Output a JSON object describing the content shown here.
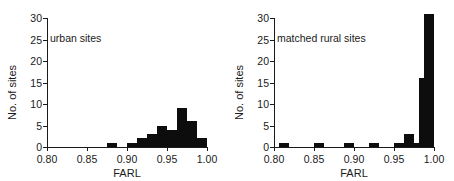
{
  "figure": {
    "panels": [
      {
        "id": "urban",
        "title": "urban sites",
        "xlabel": "FARL",
        "ylabel": "No. of sites"
      },
      {
        "id": "matched-rural",
        "title": "matched rural sites",
        "xlabel": "FARL",
        "ylabel": "No. of sites"
      }
    ],
    "colors": {
      "bar": "#0d0d0d",
      "axis": "#1a1a1a",
      "background": "#ffffff"
    }
  },
  "chart_data": [
    {
      "type": "bar",
      "title": "urban sites",
      "xlabel": "FARL",
      "ylabel": "No. of sites",
      "xlim": [
        0.8,
        1.0
      ],
      "ylim": [
        0,
        30
      ],
      "xticks": [
        "0.80",
        "0.85",
        "0.90",
        "0.95",
        "1.00"
      ],
      "xtick_values": [
        0.8,
        0.85,
        0.9,
        0.95,
        1.0
      ],
      "yticks": [
        "0",
        "5",
        "10",
        "15",
        "20",
        "25",
        "30"
      ],
      "ytick_values": [
        0,
        5,
        10,
        15,
        20,
        25,
        30
      ],
      "grid": false,
      "legend": "none",
      "bin_width": 0.0125,
      "bins": [
        {
          "left": 0.875,
          "right": 0.8875,
          "value": 1
        },
        {
          "left": 0.8875,
          "right": 0.9,
          "value": 0
        },
        {
          "left": 0.9,
          "right": 0.9125,
          "value": 1
        },
        {
          "left": 0.9125,
          "right": 0.925,
          "value": 2
        },
        {
          "left": 0.925,
          "right": 0.9375,
          "value": 3
        },
        {
          "left": 0.9375,
          "right": 0.95,
          "value": 5
        },
        {
          "left": 0.95,
          "right": 0.9625,
          "value": 4
        },
        {
          "left": 0.9625,
          "right": 0.975,
          "value": 9
        },
        {
          "left": 0.975,
          "right": 0.9875,
          "value": 6
        },
        {
          "left": 0.9875,
          "right": 1.0,
          "value": 2
        }
      ],
      "categories": [
        "0.8813",
        "0.8938",
        "0.9063",
        "0.9188",
        "0.9313",
        "0.9438",
        "0.9563",
        "0.9688",
        "0.9813",
        "0.9938"
      ],
      "values": [
        1,
        0,
        1,
        2,
        3,
        5,
        4,
        9,
        6,
        2
      ]
    },
    {
      "type": "bar",
      "title": "matched rural sites",
      "xlabel": "FARL",
      "ylabel": "No. of sites",
      "xlim": [
        0.8,
        1.0
      ],
      "ylim": [
        0,
        30
      ],
      "xticks": [
        "0.80",
        "0.85",
        "0.90",
        "0.95",
        "1.00"
      ],
      "xtick_values": [
        0.8,
        0.85,
        0.9,
        0.95,
        1.0
      ],
      "yticks": [
        "0",
        "5",
        "10",
        "15",
        "20",
        "25",
        "30"
      ],
      "ytick_values": [
        0,
        5,
        10,
        15,
        20,
        25,
        30
      ],
      "grid": false,
      "legend": "none",
      "bin_width": 0.0125,
      "bins": [
        {
          "left": 0.8063,
          "right": 0.8188,
          "value": 1
        },
        {
          "left": 0.85,
          "right": 0.8625,
          "value": 1
        },
        {
          "left": 0.8875,
          "right": 0.9,
          "value": 1
        },
        {
          "left": 0.9188,
          "right": 0.9313,
          "value": 1
        },
        {
          "left": 0.95,
          "right": 0.9625,
          "value": 1
        },
        {
          "left": 0.9625,
          "right": 0.975,
          "value": 3
        },
        {
          "left": 0.975,
          "right": 0.9813,
          "value": 1
        },
        {
          "left": 0.9813,
          "right": 0.9875,
          "value": 16
        },
        {
          "left": 0.9875,
          "right": 1.0,
          "value": 31
        }
      ],
      "categories": [
        "0.8125",
        "0.8563",
        "0.8938",
        "0.9250",
        "0.9563",
        "0.9688",
        "0.9781",
        "0.9844",
        "0.9938"
      ],
      "values": [
        1,
        1,
        1,
        1,
        1,
        3,
        1,
        16,
        31
      ]
    }
  ]
}
